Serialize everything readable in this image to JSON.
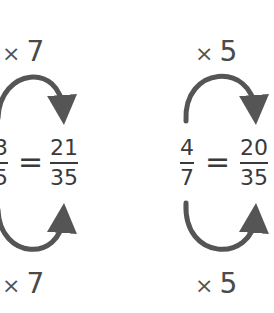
{
  "diagram": {
    "arrow_color": "#555555",
    "text_color": "#3a3a3a",
    "left": {
      "top_multiplier": {
        "symbol": "×",
        "value": "7"
      },
      "bottom_multiplier": {
        "symbol": "×",
        "value": "7"
      },
      "fraction_a": {
        "numerator": "3",
        "denominator": "5"
      },
      "equals": "=",
      "fraction_b": {
        "numerator": "21",
        "denominator": "35"
      }
    },
    "right": {
      "top_multiplier": {
        "symbol": "×",
        "value": "5"
      },
      "bottom_multiplier": {
        "symbol": "×",
        "value": "5"
      },
      "fraction_a": {
        "numerator": "4",
        "denominator": "7"
      },
      "equals": "=",
      "fraction_b": {
        "numerator": "20",
        "denominator": "35"
      }
    }
  }
}
